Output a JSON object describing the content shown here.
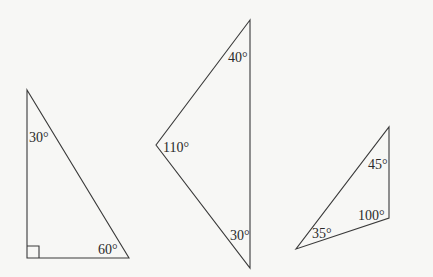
{
  "colors": {
    "background": "#f7f7f5",
    "stroke": "#3a3a3a",
    "text": "#2a2a2a"
  },
  "triangles": [
    {
      "name": "right-triangle",
      "vertices": [
        [
          27,
          90
        ],
        [
          27,
          258
        ],
        [
          129,
          258
        ]
      ],
      "right_angle_marker": true,
      "angles": [
        {
          "label": "30°",
          "x": 29,
          "y": 142
        },
        {
          "label": "60°",
          "x": 98,
          "y": 254
        }
      ]
    },
    {
      "name": "obtuse-triangle",
      "vertices": [
        [
          250,
          20
        ],
        [
          156,
          145
        ],
        [
          250,
          268
        ]
      ],
      "angles": [
        {
          "label": "40°",
          "x": 228,
          "y": 62
        },
        {
          "label": "110°",
          "x": 163,
          "y": 152
        },
        {
          "label": "30°",
          "x": 230,
          "y": 240
        }
      ]
    },
    {
      "name": "small-triangle",
      "vertices": [
        [
          389,
          127
        ],
        [
          389,
          218
        ],
        [
          296,
          249
        ]
      ],
      "angles": [
        {
          "label": "45°",
          "x": 368,
          "y": 169
        },
        {
          "label": "100°",
          "x": 358,
          "y": 220
        },
        {
          "label": "35°",
          "x": 312,
          "y": 238
        }
      ]
    }
  ]
}
